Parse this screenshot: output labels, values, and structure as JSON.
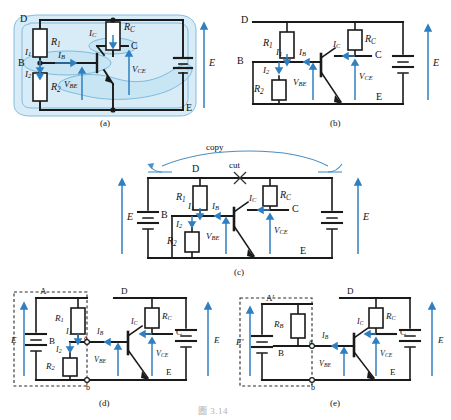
{
  "figure": {
    "type": "circuit-diagram",
    "bottom_caption": "圖 3.14",
    "panel_captions": [
      "(a)",
      "(b)",
      "(c)",
      "(d)",
      "(e)"
    ],
    "colors": {
      "wire": "#1a1a1a",
      "accent_blue": "#2f7fc1",
      "highlight_fill": "#bfe0f2",
      "highlight_stroke": "#5ba3d0",
      "annotation_blue": "#4a90c4",
      "dashed_box": "#2a2a2a",
      "caption_gray": "#6d6d6d"
    }
  },
  "panel_a": {
    "caption": "(a)",
    "nodes": {
      "d": "D",
      "b": "B",
      "c": "C",
      "e": "E"
    },
    "components": {
      "r1": "R",
      "r1_sub": "1",
      "r2": "R",
      "r2_sub": "2",
      "rc": "R",
      "rc_sub": "C"
    },
    "currents": {
      "i1": "I",
      "i1_sub": "1",
      "i2": "I",
      "i2_sub": "2",
      "ib": "I",
      "ib_sub": "B",
      "ic": "I",
      "ic_sub": "C"
    },
    "voltages": {
      "vbe": "V",
      "vbe_sub": "BE",
      "vce": "V",
      "vce_sub": "CE",
      "e_source": "E"
    },
    "highlight_note": "blue blobs grouping base node and collector node and outer loop"
  },
  "panel_b": {
    "caption": "(b)",
    "nodes": {
      "d": "D",
      "b": "B",
      "c": "C",
      "e": "E"
    },
    "components": {
      "r1": "R",
      "r1_sub": "1",
      "r2": "R",
      "r2_sub": "2",
      "rc": "R",
      "rc_sub": "C"
    },
    "currents": {
      "i1": "I",
      "i1_sub": "1",
      "i2": "I",
      "i2_sub": "2",
      "ib": "I",
      "ib_sub": "B",
      "ic": "I",
      "ic_sub": "C"
    },
    "voltages": {
      "vbe": "V",
      "vbe_sub": "BE",
      "vce": "V",
      "vce_sub": "CE",
      "e_source": "E"
    }
  },
  "panel_c": {
    "caption": "(c)",
    "annotations": {
      "copy": "copy",
      "cut": "cut"
    },
    "nodes": {
      "d": "D",
      "b": "B",
      "c": "C",
      "e": "E"
    },
    "components": {
      "r1": "R",
      "r1_sub": "1",
      "r2": "R",
      "r2_sub": "2",
      "rc": "R",
      "rc_sub": "C"
    },
    "currents": {
      "i1": "I",
      "i1_sub": "1",
      "i2": "I",
      "i2_sub": "2",
      "ib": "I",
      "ib_sub": "B",
      "ic": "I",
      "ic_sub": "C"
    },
    "voltages": {
      "vbe": "V",
      "vbe_sub": "BE",
      "vce": "V",
      "vce_sub": "CE",
      "e_left": "E",
      "e_right": "E"
    }
  },
  "panel_d": {
    "caption": "(d)",
    "nodes": {
      "a_top": "A",
      "b_mid": "B",
      "d": "D",
      "c": "C",
      "e": "E",
      "term_a": "a",
      "term_b": "b"
    },
    "components": {
      "r1": "R",
      "r1_sub": "1",
      "r2": "R",
      "r2_sub": "2",
      "rc": "R",
      "rc_sub": "C"
    },
    "currents": {
      "i1": "I",
      "i1_sub": "1",
      "i2": "I",
      "i2_sub": "2",
      "ib": "I",
      "ib_sub": "B",
      "ic": "I",
      "ic_sub": "C"
    },
    "voltages": {
      "vbe": "V",
      "vbe_sub": "BE",
      "vce": "V",
      "vce_sub": "CE",
      "e_left": "E",
      "e_right": "E"
    }
  },
  "panel_e": {
    "caption": "(e)",
    "nodes": {
      "a_top": "A′",
      "b_mid": "B",
      "d": "D",
      "c": "C",
      "e": "E",
      "term_a": "a",
      "term_b": "b"
    },
    "components": {
      "rb": "R",
      "rb_sub": "B",
      "rc": "R",
      "rc_sub": "C"
    },
    "currents": {
      "ib": "I",
      "ib_sub": "B",
      "ic": "I",
      "ic_sub": "C"
    },
    "voltages": {
      "vbe": "V",
      "vbe_sub": "BE",
      "vce": "V",
      "vce_sub": "CE",
      "e_left": "E′",
      "e_right": "E"
    }
  }
}
